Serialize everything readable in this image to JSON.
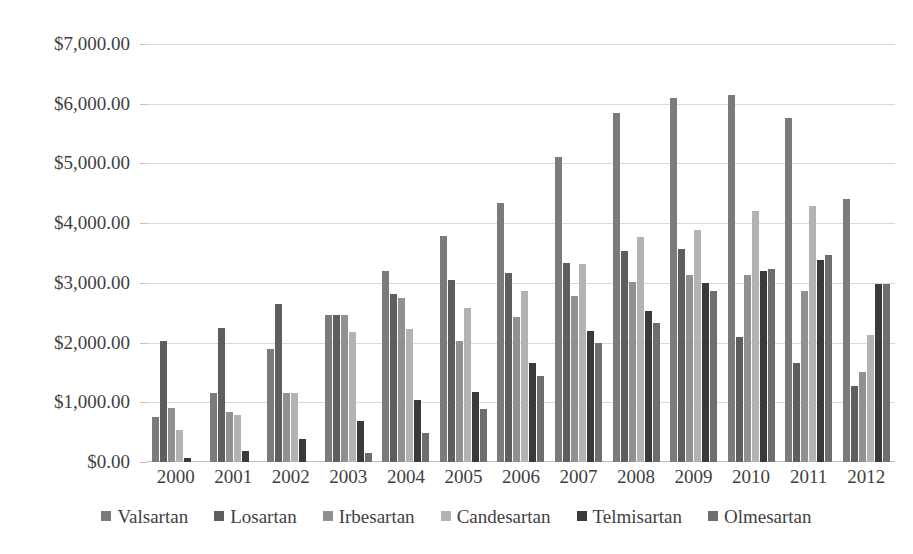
{
  "chart_data": {
    "type": "bar",
    "title": "",
    "xlabel": "",
    "ylabel": "",
    "ylim": [
      0,
      7000
    ],
    "ytick_step": 1000,
    "grid": true,
    "legend_position": "bottom",
    "y_tick_labels": [
      "$7,000.00",
      "$6,000.00",
      "$5,000.00",
      "$4,000.00",
      "$3,000.00",
      "$2,000.00",
      "$1,000.00",
      "$0.00"
    ],
    "y_tick_values": [
      7000,
      6000,
      5000,
      4000,
      3000,
      2000,
      1000,
      0
    ],
    "categories": [
      "2000",
      "2001",
      "2002",
      "2003",
      "2004",
      "2005",
      "2006",
      "2007",
      "2008",
      "2009",
      "2010",
      "2011",
      "2012"
    ],
    "series": [
      {
        "name": "Valsartan",
        "color": "#7b7b7b",
        "values": [
          760,
          1150,
          1890,
          2470,
          3200,
          3790,
          4340,
          5100,
          5840,
          6100,
          6140,
          5760,
          4400
        ]
      },
      {
        "name": "Losartan",
        "color": "#5e5e5e",
        "values": [
          2020,
          2250,
          2640,
          2460,
          2810,
          3050,
          3160,
          3340,
          3540,
          3560,
          2100,
          1660,
          1280
        ]
      },
      {
        "name": "Irbesartan",
        "color": "#919191",
        "values": [
          900,
          840,
          1160,
          2460,
          2740,
          2020,
          2430,
          2780,
          3010,
          3130,
          3130,
          2870,
          1500
        ]
      },
      {
        "name": "Candesartan",
        "color": "#b3b3b3",
        "values": [
          540,
          790,
          1160,
          2180,
          2220,
          2580,
          2860,
          3310,
          3760,
          3890,
          4200,
          4290,
          2130
        ]
      },
      {
        "name": "Telmisartan",
        "color": "#3a3a3a",
        "values": [
          60,
          190,
          380,
          680,
          1040,
          1180,
          1660,
          2190,
          2530,
          3000,
          3200,
          3390,
          2980
        ]
      },
      {
        "name": "Olmesartan",
        "color": "#6e6e6e",
        "values": [
          0,
          0,
          0,
          150,
          480,
          880,
          1440,
          2000,
          2320,
          2860,
          3230,
          3460,
          2980
        ]
      }
    ]
  },
  "legend": {
    "items": [
      {
        "label": "Valsartan"
      },
      {
        "label": "Losartan"
      },
      {
        "label": "Irbesartan"
      },
      {
        "label": "Candesartan"
      },
      {
        "label": "Telmisartan"
      },
      {
        "label": "Olmesartan"
      }
    ]
  }
}
